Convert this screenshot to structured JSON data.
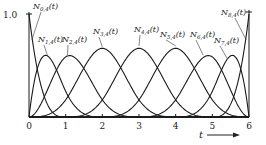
{
  "chart_data": {
    "type": "line",
    "title": "",
    "xlabel": "t",
    "ylabel": "",
    "xlim": [
      0,
      6
    ],
    "ylim": [
      0,
      1.0
    ],
    "x_ticks": [
      "0",
      "1",
      "2",
      "3",
      "4",
      "5",
      "6"
    ],
    "y_ticks": [
      "1.0"
    ],
    "grid": false,
    "legend": "none (inline labels with leader lines)",
    "order": 4,
    "knot_vector": [
      0,
      0,
      0,
      0,
      1,
      2,
      3,
      4,
      5,
      6,
      6,
      6,
      6
    ],
    "series": [
      {
        "name": "N0,4(t)",
        "label_main": "N",
        "label_sub": "0,4",
        "label_arg": "(t)",
        "peak_t": 0.0,
        "peak_value": 1.0
      },
      {
        "name": "N1,4(t)",
        "label_main": "N",
        "label_sub": "1,4",
        "label_arg": "(t)",
        "peak_t": 0.5,
        "peak_value": 0.58
      },
      {
        "name": "N2,4(t)",
        "label_main": "N",
        "label_sub": "2,4",
        "label_arg": "(t)",
        "peak_t": 1.2,
        "peak_value": 0.58
      },
      {
        "name": "N3,4(t)",
        "label_main": "N",
        "label_sub": "3,4",
        "label_arg": "(t)",
        "peak_t": 2.0,
        "peak_value": 0.66
      },
      {
        "name": "N4,4(t)",
        "label_main": "N",
        "label_sub": "4,4",
        "label_arg": "(t)",
        "peak_t": 3.0,
        "peak_value": 0.67
      },
      {
        "name": "N5,4(t)",
        "label_main": "N",
        "label_sub": "5,4",
        "label_arg": "(t)",
        "peak_t": 4.0,
        "peak_value": 0.66
      },
      {
        "name": "N6,4(t)",
        "label_main": "N",
        "label_sub": "6,4",
        "label_arg": "(t)",
        "peak_t": 4.8,
        "peak_value": 0.58
      },
      {
        "name": "N7,4(t)",
        "label_main": "N",
        "label_sub": "7,4",
        "label_arg": "(t)",
        "peak_t": 5.5,
        "peak_value": 0.58
      },
      {
        "name": "N8,4(t)",
        "label_main": "N",
        "label_sub": "8,4",
        "label_arg": "(t)",
        "peak_t": 6.0,
        "peak_value": 1.0
      }
    ],
    "annotations": {
      "x_axis_arrow_label": "t",
      "y_top_label": "1.0"
    },
    "label_positions": [
      {
        "x": 33,
        "y": 9,
        "tx": 0.08,
        "ty": 0.75
      },
      {
        "x": 38,
        "y": 42,
        "tx": 0.5,
        "ty": 0.6
      },
      {
        "x": 62,
        "y": 42,
        "tx": 1.05,
        "ty": 0.6
      },
      {
        "x": 93,
        "y": 34,
        "tx": 2.0,
        "ty": 0.68
      },
      {
        "x": 134,
        "y": 32,
        "tx": 3.0,
        "ty": 0.69
      },
      {
        "x": 160,
        "y": 37,
        "tx": 4.0,
        "ty": 0.69
      },
      {
        "x": 190,
        "y": 37,
        "tx": 4.75,
        "ty": 0.6
      },
      {
        "x": 214,
        "y": 43,
        "tx": 5.4,
        "ty": 0.57
      },
      {
        "x": 221,
        "y": 15,
        "tx": 5.92,
        "ty": 0.75
      }
    ]
  }
}
